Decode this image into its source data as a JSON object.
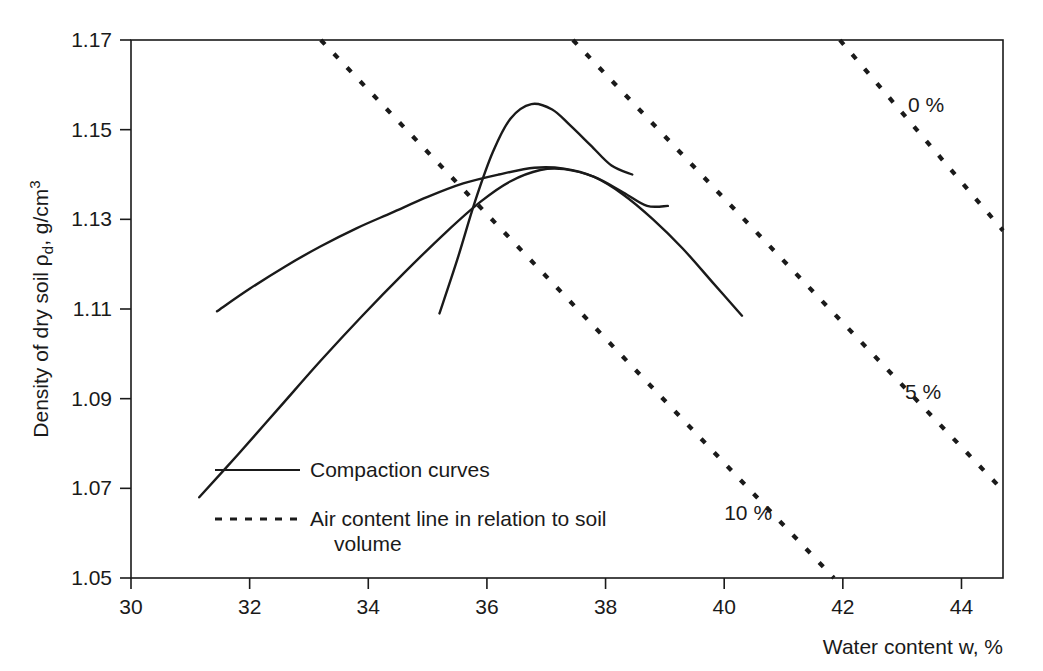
{
  "chart_data": {
    "type": "line",
    "title": "",
    "xlabel": "Water content w, %",
    "ylabel": "Density of dry soil ρd, g/cm3",
    "ylabel_parts": {
      "main": "Density of dry soil ρ",
      "sub": "d",
      "mid": ", g/cm",
      "sup": "3"
    },
    "xlim": [
      30,
      44.7
    ],
    "ylim": [
      1.05,
      1.17
    ],
    "xticks": [
      30,
      32,
      34,
      36,
      38,
      40,
      42,
      44
    ],
    "xtick_labels": [
      "30",
      "32",
      "34",
      "36",
      "38",
      "40",
      "42",
      "44"
    ],
    "yticks": [
      1.05,
      1.07,
      1.09,
      1.11,
      1.13,
      1.15,
      1.17
    ],
    "ytick_labels": [
      "1.05",
      "1.07",
      "1.09",
      "1.11",
      "1.13",
      "1.15",
      "1.17"
    ],
    "grid": false,
    "legend_position": "inside-lower-left",
    "series": [
      {
        "name": "compaction-curve-1",
        "style": "solid",
        "points": [
          [
            31.45,
            1.1095
          ],
          [
            32.0,
            1.1145
          ],
          [
            32.6,
            1.1195
          ],
          [
            33.2,
            1.124
          ],
          [
            33.8,
            1.128
          ],
          [
            34.4,
            1.1315
          ],
          [
            35.0,
            1.135
          ],
          [
            35.6,
            1.138
          ],
          [
            36.2,
            1.14
          ],
          [
            36.8,
            1.1415
          ],
          [
            37.3,
            1.1413
          ],
          [
            37.8,
            1.1395
          ],
          [
            38.3,
            1.1355
          ],
          [
            38.8,
            1.13
          ],
          [
            39.3,
            1.1235
          ],
          [
            39.8,
            1.116
          ],
          [
            40.3,
            1.1085
          ]
        ]
      },
      {
        "name": "compaction-curve-2",
        "style": "solid",
        "points": [
          [
            31.15,
            1.068
          ],
          [
            31.8,
            1.0775
          ],
          [
            32.5,
            1.088
          ],
          [
            33.2,
            1.0985
          ],
          [
            33.9,
            1.1085
          ],
          [
            34.6,
            1.118
          ],
          [
            35.3,
            1.127
          ],
          [
            35.9,
            1.134
          ],
          [
            36.4,
            1.1385
          ],
          [
            36.9,
            1.141
          ],
          [
            37.3,
            1.1412
          ],
          [
            37.8,
            1.1395
          ],
          [
            38.3,
            1.136
          ],
          [
            38.7,
            1.133
          ],
          [
            39.05,
            1.133
          ]
        ]
      },
      {
        "name": "compaction-curve-3",
        "style": "solid",
        "points": [
          [
            35.2,
            1.109
          ],
          [
            35.5,
            1.121
          ],
          [
            35.8,
            1.134
          ],
          [
            36.1,
            1.145
          ],
          [
            36.4,
            1.1525
          ],
          [
            36.75,
            1.1557
          ],
          [
            37.1,
            1.1545
          ],
          [
            37.4,
            1.151
          ],
          [
            37.75,
            1.1465
          ],
          [
            38.1,
            1.142
          ],
          [
            38.45,
            1.14
          ]
        ]
      }
    ],
    "air_content_lines": [
      {
        "name": "air-content-0",
        "label": "0 %",
        "style": "dashed",
        "x0": 41.95,
        "y0": 1.17,
        "x1": 44.7,
        "y1": 1.1275,
        "label_x": 43.1,
        "label_y": 1.1555
      },
      {
        "name": "air-content-5",
        "label": "5 %",
        "style": "dashed",
        "x0": 37.45,
        "y0": 1.17,
        "x1": 44.7,
        "y1": 1.0695,
        "label_x": 43.05,
        "label_y": 1.0915
      },
      {
        "name": "air-content-10",
        "label": "10 %",
        "style": "dashed",
        "x0": 33.2,
        "y0": 1.17,
        "x1": 41.85,
        "y1": 1.05,
        "label_x": 40.0,
        "label_y": 1.0645
      }
    ],
    "legend": [
      {
        "name": "legend-compaction",
        "label": "Compaction curves",
        "style": "solid"
      },
      {
        "name": "legend-air-content",
        "label": "Air content line in relation to soil",
        "label_line2": "volume",
        "style": "dashed"
      }
    ]
  }
}
